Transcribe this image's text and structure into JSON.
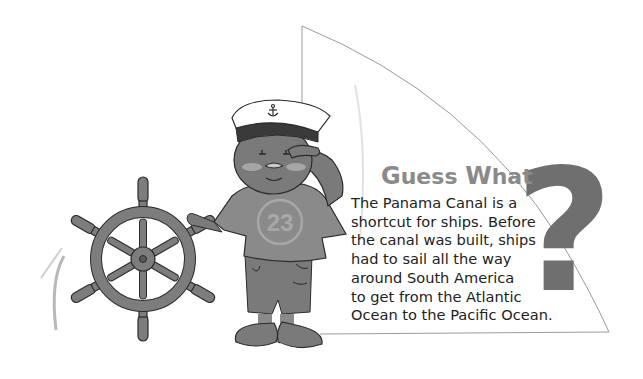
{
  "callout": {
    "title": "Guess What",
    "title_parts": [
      "G",
      "uess ",
      "W",
      "hat"
    ],
    "lines": [
      "The Panama Canal is a",
      "shortcut for ships. Before",
      "the canal was built, ships",
      "had to sail all the way",
      "around South America",
      "to get from the Atlantic",
      "Ocean to the Pacific Ocean."
    ],
    "question_mark": "?"
  },
  "illustration": {
    "shirt_number": "23",
    "hat_emblem": "anchor",
    "held_object": "ship-wheel"
  },
  "colors": {
    "figure_gray": "#7a7a7a",
    "dark_gray": "#3a3a3a",
    "light_gray": "#a6a6a6",
    "sail_line": "#9a9a9a",
    "title_gray": "#8a8a8a",
    "text": "#222222"
  }
}
